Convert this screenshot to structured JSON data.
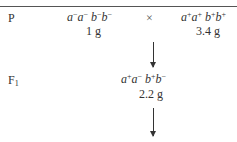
{
  "rows": {
    "parental": {
      "label": "P",
      "parent1": {
        "a1": "a",
        "a1s": "−",
        "a2": "a",
        "a2s": "−",
        "b1": "b",
        "b1s": "−",
        "b2": "b",
        "b2s": "−",
        "mass": "1 g"
      },
      "cross_symbol": "×",
      "parent2": {
        "a1": "a",
        "a1s": "+",
        "a2": "a",
        "a2s": "+",
        "b1": "b",
        "b1s": "+",
        "b2": "b",
        "b2s": "+",
        "mass": "3.4 g"
      }
    },
    "f1": {
      "label": "F",
      "label_sub": "1",
      "offspring": {
        "a1": "a",
        "a1s": "+",
        "a2": "a",
        "a2s": "−",
        "b1": "b",
        "b1s": "+",
        "b2": "b",
        "b2s": "−",
        "mass": "2.2 g"
      }
    }
  }
}
